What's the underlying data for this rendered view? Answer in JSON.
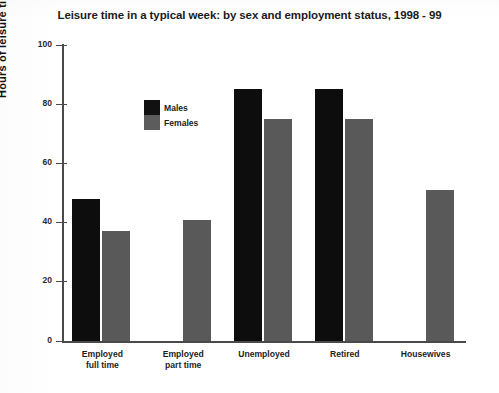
{
  "chart_data": {
    "type": "bar",
    "title": "Leisure time in a typical week: by sex and employment status, 1998 - 99",
    "xlabel": "",
    "ylabel": "Hours of leisure time",
    "ylim": [
      0,
      100
    ],
    "yticks": [
      0,
      20,
      40,
      60,
      80,
      100
    ],
    "grid": false,
    "legend_position": "top-left inside plot",
    "categories": [
      "Employed\nfull time",
      "Employed\npart time",
      "Unemployed",
      "Retired",
      "Housewives"
    ],
    "series": [
      {
        "name": "Males",
        "color": "#0d0d0d",
        "values": [
          48,
          null,
          85,
          85,
          null
        ]
      },
      {
        "name": "Females",
        "color": "#595959",
        "values": [
          37,
          41,
          75,
          75,
          51
        ]
      }
    ]
  },
  "legend": {
    "items": [
      {
        "label": "Males"
      },
      {
        "label": "Females"
      }
    ]
  },
  "axis": {
    "y_tick_labels": [
      "100",
      "80",
      "60",
      "40",
      "20",
      "0"
    ]
  }
}
